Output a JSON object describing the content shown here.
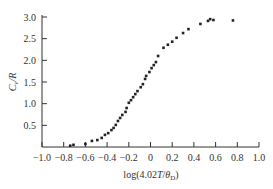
{
  "chart_data": {
    "type": "scatter",
    "title": "",
    "xlabel": "log(4.02T/θD)",
    "xlabel_parts": {
      "prefix": "log(4.02",
      "italic_T": "T",
      "slash": "/",
      "theta": "θ",
      "sub": "D",
      "suffix": ")"
    },
    "ylabel": "Cv/R",
    "ylabel_parts": {
      "C": "C",
      "sub": "v",
      "rest": "/R"
    },
    "xlim": [
      -1.0,
      1.0
    ],
    "ylim": [
      0,
      3.0
    ],
    "xticks": [
      -1.0,
      -0.8,
      -0.6,
      -0.4,
      -0.2,
      0,
      0.2,
      0.4,
      0.6,
      0.8,
      1.0
    ],
    "xtick_labels": [
      "−1.0",
      "−0.8",
      "−0.6",
      "−0.4",
      "−0.2",
      "0",
      "0.2",
      "0.4",
      "0.6",
      "0.8",
      "1.0"
    ],
    "yticks": [
      0.5,
      1.0,
      1.5,
      2.0,
      2.5,
      3.0
    ],
    "ytick_labels": [
      "0.5",
      "1.0",
      "1.5",
      "2.0",
      "2.5",
      "3.0"
    ],
    "grid": false,
    "legend": null,
    "marker_color": "#222222",
    "series": [
      {
        "name": "Cv/R",
        "points": [
          [
            -0.74,
            0.03
          ],
          [
            -0.71,
            0.05
          ],
          [
            -0.6,
            0.07
          ],
          [
            -0.54,
            0.14
          ],
          [
            -0.49,
            0.16
          ],
          [
            -0.45,
            0.21
          ],
          [
            -0.42,
            0.28
          ],
          [
            -0.39,
            0.32
          ],
          [
            -0.36,
            0.39
          ],
          [
            -0.34,
            0.44
          ],
          [
            -0.32,
            0.51
          ],
          [
            -0.3,
            0.6
          ],
          [
            -0.28,
            0.67
          ],
          [
            -0.26,
            0.74
          ],
          [
            -0.23,
            0.81
          ],
          [
            -0.22,
            0.9
          ],
          [
            -0.2,
            1.02
          ],
          [
            -0.18,
            1.08
          ],
          [
            -0.16,
            1.15
          ],
          [
            -0.14,
            1.22
          ],
          [
            -0.12,
            1.29
          ],
          [
            -0.09,
            1.38
          ],
          [
            -0.07,
            1.45
          ],
          [
            -0.05,
            1.57
          ],
          [
            -0.04,
            1.64
          ],
          [
            -0.01,
            1.73
          ],
          [
            0.01,
            1.82
          ],
          [
            0.03,
            1.89
          ],
          [
            0.05,
            1.96
          ],
          [
            0.07,
            2.1
          ],
          [
            0.12,
            2.29
          ],
          [
            0.16,
            2.36
          ],
          [
            0.2,
            2.43
          ],
          [
            0.24,
            2.52
          ],
          [
            0.3,
            2.63
          ],
          [
            0.35,
            2.72
          ],
          [
            0.46,
            2.84
          ],
          [
            0.53,
            2.91
          ],
          [
            0.55,
            2.95
          ],
          [
            0.58,
            2.93
          ],
          [
            0.76,
            2.92
          ]
        ]
      }
    ]
  }
}
